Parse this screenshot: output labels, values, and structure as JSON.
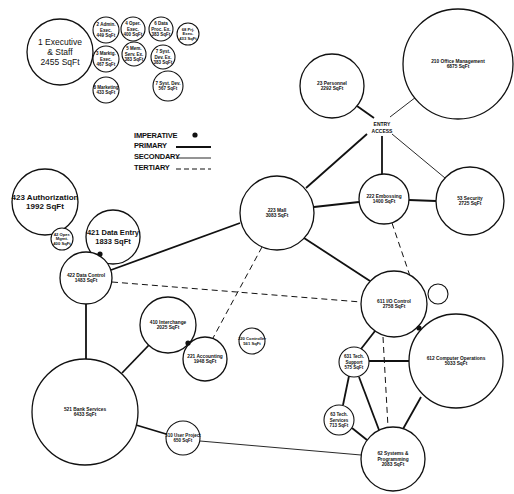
{
  "diagram": {
    "type": "space adjacency bubble diagram",
    "legend": {
      "imperative": "IMPERATIVE",
      "primary": "PRIMARY",
      "secondary": "SECONDARY",
      "tertiary": "TERTIARY"
    },
    "entry_access": {
      "line1": "ENTRY",
      "line2": "ACCESS"
    },
    "nodes": [
      {
        "id": "n1",
        "lines": [
          "1 Executive",
          "& Staff",
          "2455 SqFt"
        ],
        "cx": 60,
        "cy": 52,
        "r": 33,
        "fs": 8.5,
        "bold": false
      },
      {
        "id": "n2",
        "lines": [
          "2 Admin.",
          "Exec.",
          "449 SqFt"
        ],
        "cx": 106,
        "cy": 30,
        "r": 13,
        "fs": 4.5
      },
      {
        "id": "n4",
        "lines": [
          "4 Oper.",
          "Exec.",
          "400 SqFt"
        ],
        "cx": 133,
        "cy": 29,
        "r": 12,
        "fs": 4.5
      },
      {
        "id": "n6",
        "lines": [
          "6 Data",
          "Proc. Ex.",
          "383 SqFt"
        ],
        "cx": 161,
        "cy": 29,
        "r": 12,
        "fs": 4.5
      },
      {
        "id": "n68",
        "lines": [
          "68 Prj.",
          "Exec.",
          "433 SqFt"
        ],
        "cx": 188,
        "cy": 34,
        "r": 11,
        "fs": 4.2
      },
      {
        "id": "n3",
        "lines": [
          "3 Marktg.",
          "Exec.",
          "467 SqFt"
        ],
        "cx": 106,
        "cy": 59,
        "r": 13,
        "fs": 4.5
      },
      {
        "id": "n5",
        "lines": [
          "5 Mem.",
          "Serv. Ex.",
          "383 SqFt"
        ],
        "cx": 134,
        "cy": 54,
        "r": 12,
        "fs": 4.5
      },
      {
        "id": "n7a",
        "lines": [
          "7 Syst.",
          "Dev. Ex.",
          "383 SqFt"
        ],
        "cx": 163,
        "cy": 57,
        "r": 12,
        "fs": 4.5
      },
      {
        "id": "n8",
        "lines": [
          "8 Marketing",
          "433 SqFt"
        ],
        "cx": 106,
        "cy": 90,
        "r": 13,
        "fs": 4.5
      },
      {
        "id": "n7b",
        "lines": [
          "7 Syst. Dev.",
          "567 SqFt"
        ],
        "cx": 168,
        "cy": 86,
        "r": 15,
        "fs": 4.5
      },
      {
        "id": "n23",
        "lines": [
          "23 Personnel",
          "2292 SqFt"
        ],
        "cx": 332,
        "cy": 86,
        "r": 32,
        "fs": 4.8
      },
      {
        "id": "n210",
        "lines": [
          "210 Office Management",
          "6875 SqFt"
        ],
        "cx": 458,
        "cy": 64,
        "r": 55,
        "fs": 4.8
      },
      {
        "id": "n423",
        "lines": [
          "423 Authorization",
          "1992 SqFt"
        ],
        "cx": 45,
        "cy": 202,
        "r": 33,
        "fs": 8,
        "bold": true
      },
      {
        "id": "n421",
        "lines": [
          "421 Data Entry",
          "1833 SqFt"
        ],
        "cx": 113,
        "cy": 237,
        "r": 27,
        "fs": 7.5,
        "bold": true
      },
      {
        "id": "n42",
        "lines": [
          "42 Oper.",
          "Mgmt.",
          "400 SqFt"
        ],
        "cx": 62,
        "cy": 239,
        "r": 11,
        "fs": 4.2
      },
      {
        "id": "n422",
        "lines": [
          "422 Data Control",
          "1483 SqFt"
        ],
        "cx": 86,
        "cy": 278,
        "r": 26,
        "fs": 4.8
      },
      {
        "id": "n223",
        "lines": [
          "223 Mall",
          "3083 SqFt"
        ],
        "cx": 277,
        "cy": 213,
        "r": 37,
        "fs": 4.8
      },
      {
        "id": "n222",
        "lines": [
          "222 Embossing",
          "1400 SqFt"
        ],
        "cx": 384,
        "cy": 199,
        "r": 25,
        "fs": 4.8
      },
      {
        "id": "n53",
        "lines": [
          "53 Security",
          "2725 SqFt"
        ],
        "cx": 470,
        "cy": 201,
        "r": 34,
        "fs": 4.8
      },
      {
        "id": "n410",
        "lines": [
          "410 Interchange",
          "2025 SqFt"
        ],
        "cx": 168,
        "cy": 325,
        "r": 28,
        "fs": 4.8
      },
      {
        "id": "n221",
        "lines": [
          "221 Accounting",
          "1948 SqFt"
        ],
        "cx": 205,
        "cy": 359,
        "r": 22,
        "fs": 4.8
      },
      {
        "id": "n220",
        "lines": [
          "220 Controller",
          "561 SqFt"
        ],
        "cx": 252,
        "cy": 341,
        "r": 13,
        "fs": 4.2
      },
      {
        "id": "n611",
        "lines": [
          "611 I/O Control",
          "2758 SqFt"
        ],
        "cx": 394,
        "cy": 304,
        "r": 33,
        "fs": 4.8
      },
      {
        "id": "n612",
        "lines": [
          "612 Computer Operations",
          "5033 SqFt"
        ],
        "cx": 456,
        "cy": 361,
        "r": 47,
        "fs": 4.8
      },
      {
        "id": "n631",
        "lines": [
          "631 Tech.",
          "Support",
          "575 SqFt"
        ],
        "cx": 354,
        "cy": 362,
        "r": 15,
        "fs": 4.5
      },
      {
        "id": "n63",
        "lines": [
          "63 Tech.",
          "Services",
          "713 SqFt"
        ],
        "cx": 339,
        "cy": 420,
        "r": 15,
        "fs": 4.5
      },
      {
        "id": "n62",
        "lines": [
          "62 Systems &",
          "Programming",
          "2083 SqFt"
        ],
        "cx": 393,
        "cy": 459,
        "r": 32,
        "fs": 4.8
      },
      {
        "id": "n521",
        "lines": [
          "521 Bank Services",
          "6433 SqFt"
        ],
        "cx": 85,
        "cy": 412,
        "r": 53,
        "fs": 4.8
      },
      {
        "id": "n510",
        "lines": [
          "510 User Project",
          "650 SqFt"
        ],
        "cx": 183,
        "cy": 438,
        "r": 17,
        "fs": 4.5
      }
    ],
    "unlabeled_circles": [
      {
        "id": "empty1",
        "cx": 438,
        "cy": 294,
        "r": 10
      }
    ],
    "connections": [
      {
        "from": "n23",
        "to": "entry",
        "type": "primary",
        "x1": 357,
        "y1": 106,
        "x2": 374,
        "y2": 118
      },
      {
        "from": "n210",
        "to": "entry",
        "type": "secondary",
        "x1": 416,
        "y1": 97,
        "x2": 390,
        "y2": 117
      },
      {
        "from": "entry",
        "to": "n223",
        "type": "primary",
        "x1": 367,
        "y1": 134,
        "x2": 306,
        "y2": 188
      },
      {
        "from": "entry",
        "to": "n222",
        "type": "primary",
        "x1": 382,
        "y1": 136,
        "x2": 382,
        "y2": 174
      },
      {
        "from": "entry",
        "to": "n53",
        "type": "secondary",
        "x1": 392,
        "y1": 134,
        "x2": 445,
        "y2": 178
      },
      {
        "from": "n223",
        "to": "n222",
        "type": "primary",
        "x1": 314,
        "y1": 207,
        "x2": 359,
        "y2": 202
      },
      {
        "from": "n222",
        "to": "n53",
        "type": "primary",
        "x1": 409,
        "y1": 200,
        "x2": 436,
        "y2": 201
      },
      {
        "from": "n223",
        "to": "n611",
        "type": "primary",
        "x1": 304,
        "y1": 238,
        "x2": 370,
        "y2": 281
      },
      {
        "from": "n223",
        "to": "n422",
        "type": "primary",
        "x1": 240,
        "y1": 223,
        "x2": 111,
        "y2": 270
      },
      {
        "from": "n222",
        "to": "n611",
        "type": "tertiary",
        "x1": 392,
        "y1": 223,
        "x2": 410,
        "y2": 276
      },
      {
        "from": "n223",
        "to": "n221",
        "type": "tertiary",
        "x1": 262,
        "y1": 247,
        "x2": 213,
        "y2": 338
      },
      {
        "from": "n422",
        "to": "n611",
        "type": "tertiary",
        "x1": 112,
        "y1": 282,
        "x2": 361,
        "y2": 302
      },
      {
        "from": "n422",
        "to": "n521",
        "type": "primary",
        "x1": 86,
        "y1": 304,
        "x2": 86,
        "y2": 359
      },
      {
        "from": "n410",
        "to": "n521",
        "type": "primary",
        "x1": 149,
        "y1": 345,
        "x2": 122,
        "y2": 373
      },
      {
        "from": "n521",
        "to": "n510",
        "type": "primary",
        "x1": 136,
        "y1": 425,
        "x2": 166,
        "y2": 434
      },
      {
        "from": "n510",
        "to": "n62",
        "type": "secondary",
        "x1": 200,
        "y1": 441,
        "x2": 361,
        "y2": 455
      },
      {
        "from": "n611",
        "to": "n631",
        "type": "primary",
        "x1": 375,
        "y1": 331,
        "x2": 361,
        "y2": 349
      },
      {
        "from": "n611",
        "to": "n62",
        "type": "tertiary",
        "x1": 383,
        "y1": 337,
        "x2": 388,
        "y2": 427
      },
      {
        "from": "n631",
        "to": "n612",
        "type": "primary",
        "x1": 369,
        "y1": 361,
        "x2": 409,
        "y2": 361
      },
      {
        "from": "n631",
        "to": "n63",
        "type": "primary",
        "x1": 349,
        "y1": 376,
        "x2": 343,
        "y2": 405
      },
      {
        "from": "n631",
        "to": "n62",
        "type": "primary",
        "x1": 359,
        "y1": 377,
        "x2": 379,
        "y2": 430
      },
      {
        "from": "n63",
        "to": "n62",
        "type": "primary",
        "x1": 352,
        "y1": 428,
        "x2": 367,
        "y2": 440
      },
      {
        "from": "n612",
        "to": "n62",
        "type": "primary",
        "x1": 421,
        "y1": 397,
        "x2": 403,
        "y2": 429
      }
    ],
    "imperative_dots": [
      {
        "between": [
          "n421",
          "n422"
        ],
        "x": 100,
        "y": 254
      },
      {
        "between": [
          "n410",
          "n221"
        ],
        "x": 188,
        "y": 343
      },
      {
        "between": [
          "n611",
          "n612"
        ],
        "x": 419,
        "y": 328
      }
    ],
    "colors": {
      "ink": "#111111",
      "background": "#ffffff"
    }
  }
}
